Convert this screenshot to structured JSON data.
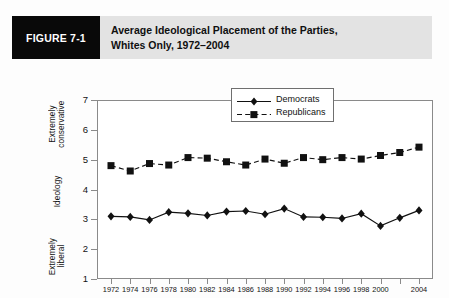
{
  "figure": {
    "tag": "FIGURE 7-1",
    "title_line1": "Average Ideological Placement of the Parties,",
    "title_line2": "Whites Only, 1972–2004"
  },
  "axis_captions": {
    "top": "Extremely\nconservative",
    "middle": "Ideology",
    "bottom": "Extremely\nliberal"
  },
  "colors": {
    "tag_background": "#090909",
    "tag_text": "#ffffff",
    "header_background": "#e3e3e3",
    "plot_border": "#8a8a8a",
    "series": "#111111"
  },
  "chart_data": {
    "type": "line",
    "title": "Average Ideological Placement of the Parties, Whites Only, 1972–2004",
    "xlabel": "Year",
    "ylabel": "Ideology",
    "x": [
      1972,
      1974,
      1976,
      1978,
      1980,
      1982,
      1984,
      1986,
      1988,
      1990,
      1992,
      1994,
      1996,
      1998,
      2000,
      2002,
      2004
    ],
    "xtick_labels": [
      "1972",
      "1974",
      "1976",
      "1978",
      "1980",
      "1982",
      "1984",
      "1986",
      "1988",
      "1990",
      "1992",
      "1994",
      "1996",
      "1998",
      "2000",
      "",
      "2004"
    ],
    "ylim": [
      1,
      7
    ],
    "yticks": [
      1,
      2,
      3,
      4,
      5,
      6,
      7
    ],
    "ytick_labels": [
      "1",
      "2",
      "3",
      "4",
      "5",
      "6",
      "7"
    ],
    "grid": false,
    "legend_position": "top-right",
    "series": [
      {
        "name": "Democrats",
        "marker": "diamond",
        "linestyle": "solid",
        "values": [
          3.1,
          3.08,
          2.98,
          3.24,
          3.2,
          3.13,
          3.26,
          3.28,
          3.17,
          3.36,
          3.08,
          3.07,
          3.03,
          3.19,
          2.78,
          3.05,
          3.3
        ]
      },
      {
        "name": "Republicans",
        "marker": "square",
        "linestyle": "dashed",
        "values": [
          4.8,
          4.62,
          4.87,
          4.82,
          5.07,
          5.05,
          4.93,
          4.82,
          5.02,
          4.88,
          5.07,
          5.0,
          5.07,
          5.02,
          5.14,
          5.24,
          5.42
        ]
      }
    ]
  }
}
